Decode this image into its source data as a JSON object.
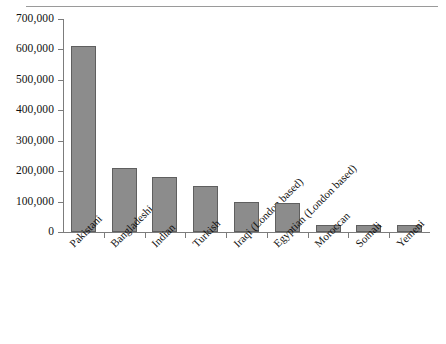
{
  "chart_data": {
    "type": "bar",
    "title": "",
    "subtitle": "",
    "xlabel": "",
    "ylabel": "",
    "ylim": [
      0,
      700000
    ],
    "y_ticks": [
      0,
      100000,
      200000,
      300000,
      400000,
      500000,
      600000,
      700000
    ],
    "y_tick_labels": [
      "0",
      "100,000",
      "200,000",
      "300,000",
      "400,000",
      "500,000",
      "600,000",
      "700,000"
    ],
    "grid": false,
    "legend": null,
    "categories": [
      "Pakistani",
      "Bangladeshi",
      "Indian",
      "Turkish",
      "Iraqi (London based)",
      "Egyptian (London based)",
      "Moroccan",
      "Somali",
      "Yemeni"
    ],
    "values": [
      610000,
      210000,
      180000,
      152000,
      100000,
      95000,
      23000,
      23000,
      24000
    ],
    "bar_color": "#8c8c8c",
    "bar_border_color": "#5f5f5f",
    "axis_color": "#7c7c7c"
  }
}
